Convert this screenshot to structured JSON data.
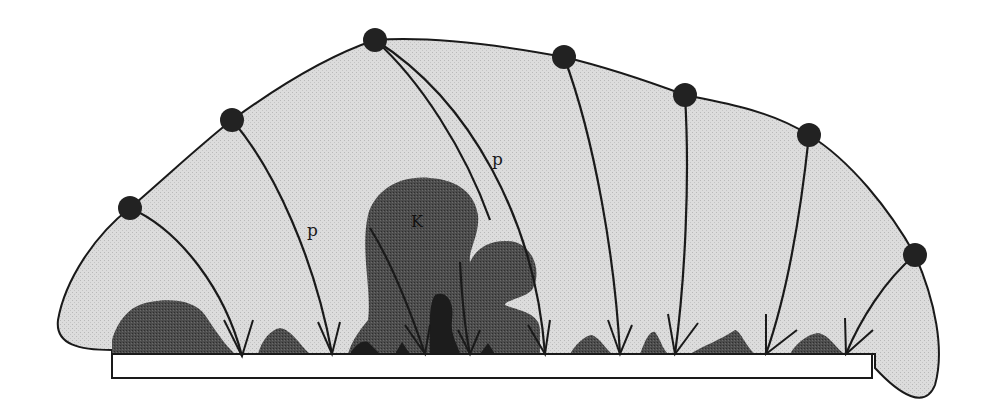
{
  "figure": {
    "labels": {
      "trajectory_left": "p",
      "trajectory_center": "p",
      "central_feature": "K"
    },
    "colors": {
      "background": "#ffffff",
      "envelope_fill": "#d9d9d9",
      "deposit_fill": "#4a4a4a",
      "deposit_dark": "#1e1e1e",
      "stroke": "#1a1a1a",
      "source_point": "#222222",
      "substrate": "#ffffff"
    },
    "source_points": [
      {
        "x": 130,
        "y": 208
      },
      {
        "x": 232,
        "y": 120
      },
      {
        "x": 375,
        "y": 40
      },
      {
        "x": 564,
        "y": 57
      },
      {
        "x": 685,
        "y": 95
      },
      {
        "x": 809,
        "y": 135
      },
      {
        "x": 915,
        "y": 255
      }
    ],
    "impact_points": [
      {
        "x": 242,
        "y": 356
      },
      {
        "x": 332,
        "y": 354
      },
      {
        "x": 425,
        "y": 354
      },
      {
        "x": 470,
        "y": 354
      },
      {
        "x": 545,
        "y": 354
      },
      {
        "x": 620,
        "y": 354
      },
      {
        "x": 675,
        "y": 354
      },
      {
        "x": 766,
        "y": 354
      },
      {
        "x": 846,
        "y": 354
      }
    ]
  }
}
